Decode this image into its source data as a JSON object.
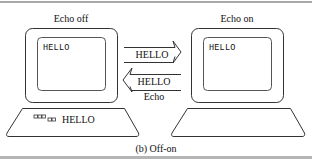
{
  "diagram": {
    "left_terminal": {
      "title": "Echo off",
      "screen_text": "HELLO",
      "keyboard_text": "HELLO",
      "keyboard_keys_glyph": "□□□□□"
    },
    "right_terminal": {
      "title": "Echo on",
      "screen_text": "HELLO"
    },
    "arrows": [
      {
        "direction": "right",
        "label": "HELLO"
      },
      {
        "direction": "left",
        "label": "HELLO",
        "sublabel": "Echo"
      }
    ],
    "caption": "(b) Off-on",
    "colors": {
      "stroke": "#333333",
      "rule": "#a9a9a9",
      "background": "#ffffff"
    }
  }
}
